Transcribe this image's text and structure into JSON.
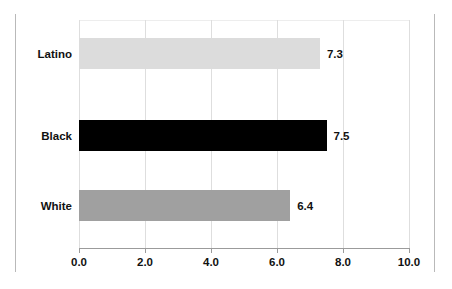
{
  "chart_data": {
    "type": "bar",
    "orientation": "horizontal",
    "title": "",
    "xlabel": "",
    "ylabel": "",
    "categories": [
      "Latino",
      "Black",
      "White"
    ],
    "values": [
      7.3,
      7.5,
      6.4
    ],
    "value_labels": [
      "7.3",
      "7.5",
      "6.4"
    ],
    "series": [
      {
        "name": "",
        "values": [
          7.3,
          7.5,
          6.4
        ]
      }
    ],
    "xlim": [
      0,
      10
    ],
    "xticks": [
      0,
      2,
      4,
      6,
      8,
      10
    ],
    "xtick_labels": [
      "0.0",
      "2.0",
      "4.0",
      "6.0",
      "8.0",
      "10.0"
    ],
    "grid": true,
    "grid_axis": "x",
    "legend": false,
    "bar_colors": [
      "#dcdcdc",
      "#000000",
      "#a0a0a0"
    ]
  },
  "chart": {
    "clipped_title": "",
    "colors": {
      "bar_latino": "#dcdcdc",
      "bar_black": "#000000",
      "bar_white": "#a0a0a0",
      "gridline": "#dedede",
      "axis": "#9b9b9b",
      "frame": "#b9b9b9",
      "text": "#111111"
    }
  }
}
